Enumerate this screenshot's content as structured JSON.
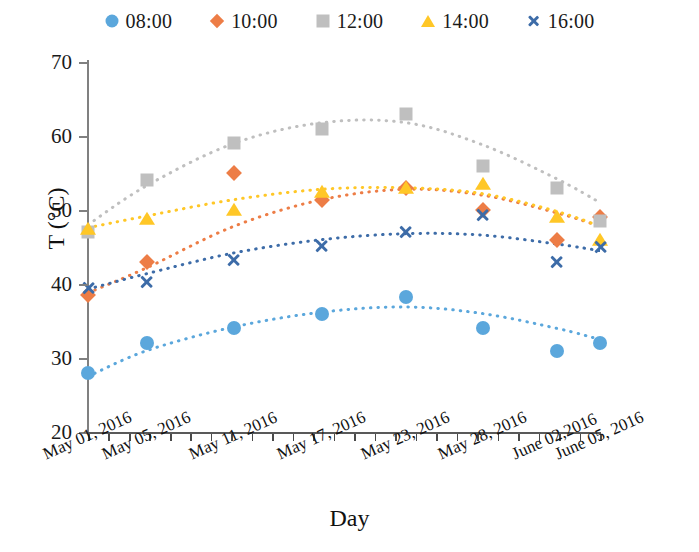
{
  "legend": {
    "position": "top",
    "items": [
      {
        "label": "08:00",
        "marker": "circle",
        "color": "#5BA7DC"
      },
      {
        "label": "10:00",
        "marker": "diamond",
        "color": "#ED7D46"
      },
      {
        "label": "12:00",
        "marker": "square",
        "color": "#BFBFBF"
      },
      {
        "label": "14:00",
        "marker": "triangle",
        "color": "#FFC727"
      },
      {
        "label": "16:00",
        "marker": "x",
        "color": "#3D6CA8"
      }
    ]
  },
  "axes": {
    "y_title": "T (°C)",
    "x_title": "Day",
    "y_ticks": [
      "20",
      "30",
      "40",
      "50",
      "60",
      "70"
    ],
    "y_min": 20,
    "y_max": 70,
    "y_step": 10
  },
  "chart_data": {
    "type": "scatter",
    "title": "",
    "xlabel": "Day",
    "ylabel": "T (°C)",
    "ylim": [
      20,
      70
    ],
    "grid": false,
    "legend_position": "top",
    "categories": [
      "May 01, 2016",
      "May 05, 2016",
      "May 11, 2016",
      "May 17, 2016",
      "May 23, 2016",
      "May 28, 2016",
      "June 02,2016",
      "June 05, 2016"
    ],
    "series": [
      {
        "name": "08:00",
        "color": "#5BA7DC",
        "marker": "circle",
        "values": [
          28.0,
          32.0,
          34.0,
          36.0,
          38.3,
          34.0,
          31.0,
          32.0
        ],
        "trend": [
          27.5,
          31.0,
          34.2,
          36.2,
          36.9,
          36.0,
          34.0,
          32.5
        ]
      },
      {
        "name": "10:00",
        "color": "#ED7D46",
        "marker": "diamond",
        "values": [
          38.5,
          43.0,
          55.0,
          51.3,
          53.0,
          50.0,
          46.0,
          49.0
        ],
        "trend": [
          38.8,
          42.2,
          47.8,
          51.4,
          52.8,
          52.0,
          49.6,
          47.8
        ]
      },
      {
        "name": "12:00",
        "color": "#BFBFBF",
        "marker": "square",
        "values": [
          47.0,
          54.0,
          59.0,
          61.0,
          63.0,
          56.0,
          53.0,
          48.5
        ],
        "trend": [
          48.0,
          53.3,
          59.0,
          61.8,
          61.8,
          58.8,
          54.2,
          51.0
        ]
      },
      {
        "name": "14:00",
        "color": "#FFC727",
        "marker": "triangle",
        "values": [
          47.5,
          48.8,
          50.0,
          52.5,
          53.0,
          53.5,
          49.0,
          46.0
        ],
        "trend": [
          47.6,
          49.2,
          51.4,
          52.8,
          53.0,
          52.2,
          49.8,
          47.8
        ]
      },
      {
        "name": "16:00",
        "color": "#3D6CA8",
        "marker": "x",
        "values": [
          39.5,
          40.3,
          43.3,
          45.2,
          47.0,
          49.3,
          43.0,
          45.0
        ],
        "trend": [
          39.3,
          41.4,
          44.2,
          46.0,
          46.8,
          46.6,
          45.4,
          44.5
        ]
      }
    ]
  }
}
